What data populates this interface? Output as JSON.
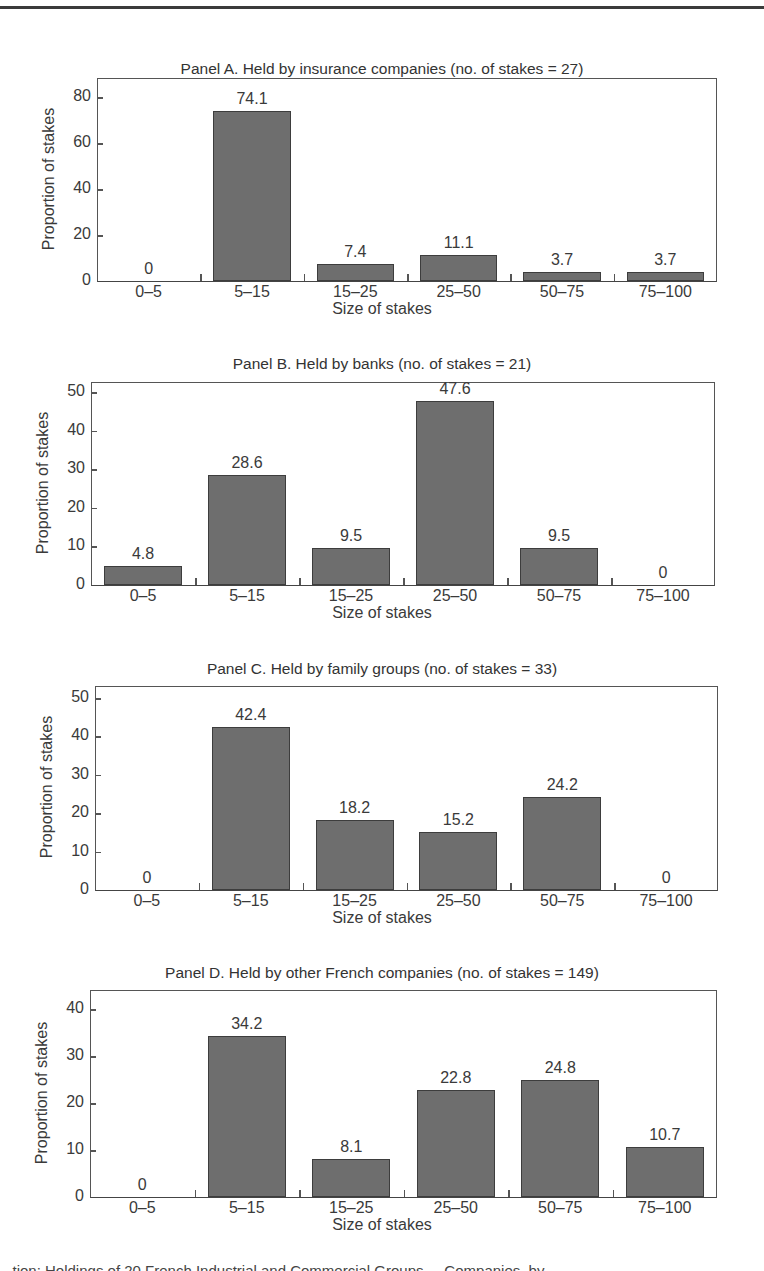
{
  "chart_data": [
    {
      "type": "bar",
      "title": "Panel A. Held by insurance companies (no. of stakes = 27)",
      "xlabel": "Size of stakes",
      "ylabel": "Proportion of stakes",
      "categories": [
        "0–5",
        "5–15",
        "15–25",
        "25–50",
        "50–75",
        "75–100"
      ],
      "values": [
        0,
        74.1,
        7.4,
        11.1,
        3.7,
        3.7
      ],
      "value_labels": [
        "0",
        "74.1",
        "7.4",
        "11.1",
        "3.7",
        "3.7"
      ],
      "yticks": [
        0,
        20,
        40,
        60,
        80
      ],
      "ylim": [
        0,
        85
      ],
      "grid": false,
      "legend": null
    },
    {
      "type": "bar",
      "title": "Panel B. Held by banks (no. of stakes = 21)",
      "xlabel": "Size of stakes",
      "ylabel": "Proportion of stakes",
      "categories": [
        "0–5",
        "5–15",
        "15–25",
        "25–50",
        "50–75",
        "75–100"
      ],
      "values": [
        4.8,
        28.6,
        9.5,
        47.6,
        9.5,
        0
      ],
      "value_labels": [
        "4.8",
        "28.6",
        "9.5",
        "47.6",
        "9.5",
        "0"
      ],
      "yticks": [
        0,
        10,
        20,
        30,
        40,
        50
      ],
      "ylim": [
        0,
        53
      ],
      "grid": false,
      "legend": null
    },
    {
      "type": "bar",
      "title": "Panel C. Held by family groups (no. of stakes = 33)",
      "xlabel": "Size of stakes",
      "ylabel": "Proportion of stakes",
      "categories": [
        "0–5",
        "5–15",
        "15–25",
        "25–50",
        "50–75",
        "75–100"
      ],
      "values": [
        0,
        42.4,
        18.2,
        15.2,
        24.2,
        0
      ],
      "value_labels": [
        "0",
        "42.4",
        "18.2",
        "15.2",
        "24.2",
        "0"
      ],
      "yticks": [
        0,
        10,
        20,
        30,
        40,
        50
      ],
      "ylim": [
        0,
        53
      ],
      "grid": false,
      "legend": null
    },
    {
      "type": "bar",
      "title": "Panel D. Held by other French companies (no. of stakes = 149)",
      "xlabel": "Size of stakes",
      "ylabel": "Proportion of stakes",
      "categories": [
        "0–5",
        "5–15",
        "15–25",
        "25–50",
        "50–75",
        "75–100"
      ],
      "values": [
        0,
        34.2,
        8.1,
        22.8,
        24.8,
        10.7
      ],
      "value_labels": [
        "0",
        "34.2",
        "8.1",
        "22.8",
        "24.8",
        "10.7"
      ],
      "yticks": [
        0,
        10,
        20,
        30,
        40
      ],
      "ylim": [
        0,
        44
      ],
      "grid": false,
      "legend": null
    }
  ],
  "caption": "...tion: Holdings of 20 French Industrial and Commercial Groups ... Companies, by ...",
  "colors": {
    "bar_fill": "#6e6e6e",
    "bar_edge": "#3d3d3d",
    "axis": "#555555",
    "text": "#3a3a3a"
  }
}
